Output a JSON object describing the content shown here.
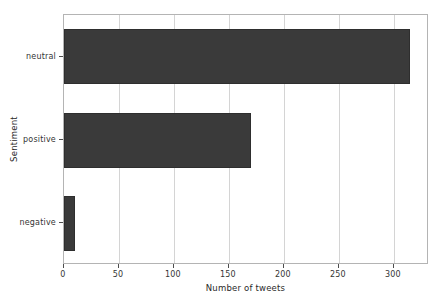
{
  "chart_data": {
    "type": "bar",
    "orientation": "horizontal",
    "title": "",
    "subtitle": "",
    "xlabel": "Number of tweets",
    "ylabel": "Sentiment",
    "categories": [
      "negative",
      "positive",
      "neutral"
    ],
    "values": [
      10,
      170,
      315
    ],
    "series": [
      {
        "name": "Number of tweets",
        "values": [
          10,
          170,
          315
        ]
      }
    ],
    "xlim": [
      0,
      332
    ],
    "xticks": [
      0,
      50,
      100,
      150,
      200,
      250,
      300
    ],
    "xtick_labels": [
      "0",
      "50",
      "100",
      "150",
      "200",
      "250",
      "300"
    ],
    "ytick_labels": [
      "negative",
      "positive",
      "neutral"
    ],
    "grid": "vertical-only",
    "legend": "none",
    "bar_color": "#3a3a3a",
    "grid_color": "#d4d4d4",
    "axis_color": "#b4b4b4",
    "background_color": "#ffffff"
  }
}
